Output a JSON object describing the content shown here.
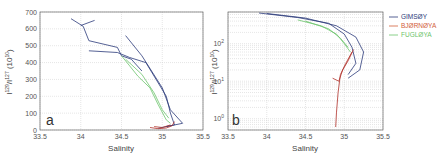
{
  "chart_data": [
    {
      "panel": "a",
      "type": "line",
      "title": "",
      "xlabel": "Salinity",
      "ylabel": "I(129)/I(127) (10^10)",
      "xlim": [
        33.5,
        35.5
      ],
      "ylim": [
        0,
        700
      ],
      "xticks": [
        "33.5",
        "34",
        "34.5",
        "35",
        "35.5"
      ],
      "yticks": [
        "0",
        "100",
        "200",
        "300",
        "400",
        "500",
        "600",
        "700"
      ],
      "grid": true,
      "yscale": "linear",
      "series": [
        {
          "name": "GIMSØY",
          "color": "#2b3a7a",
          "points": [
            [
              33.88,
              660
            ],
            [
              34.03,
              615
            ],
            [
              34.1,
              530
            ],
            [
              34.45,
              490
            ],
            [
              34.5,
              440
            ],
            [
              34.62,
              420
            ],
            [
              34.75,
              350
            ]
          ]
        },
        {
          "name": "GIMSØY",
          "color": "#2b3a7a",
          "points": [
            [
              34.1,
              470
            ],
            [
              34.45,
              460
            ],
            [
              34.6,
              430
            ],
            [
              34.8,
              400
            ],
            [
              35.05,
              200
            ],
            [
              35.1,
              100
            ],
            [
              35.15,
              30
            ],
            [
              34.95,
              10
            ]
          ]
        },
        {
          "name": "GIMSØY",
          "color": "#2b3a7a",
          "points": [
            [
              34.55,
              560
            ],
            [
              34.75,
              440
            ],
            [
              35.0,
              250
            ],
            [
              35.1,
              120
            ],
            [
              35.25,
              40
            ],
            [
              35.05,
              20
            ]
          ]
        },
        {
          "name": "GIMSØY",
          "color": "#2b3a7a",
          "points": [
            [
              34.0,
              620
            ],
            [
              34.17,
              650
            ]
          ]
        },
        {
          "name": "FUGLØYA",
          "color": "#6cc46c",
          "points": [
            [
              34.5,
              440
            ],
            [
              34.6,
              380
            ],
            [
              34.7,
              320
            ],
            [
              34.85,
              250
            ],
            [
              34.95,
              150
            ],
            [
              35.05,
              60
            ],
            [
              35.1,
              40
            ]
          ]
        },
        {
          "name": "FUGLØYA",
          "color": "#6cc46c",
          "points": [
            [
              34.55,
              420
            ],
            [
              34.75,
              330
            ],
            [
              34.9,
              220
            ],
            [
              35.0,
              120
            ],
            [
              35.08,
              70
            ]
          ]
        },
        {
          "name": "BJØRNØYA",
          "color": "#b0302a",
          "points": [
            [
              34.85,
              15
            ],
            [
              34.95,
              8
            ],
            [
              35.05,
              12
            ],
            [
              35.12,
              25
            ],
            [
              35.15,
              50
            ]
          ]
        },
        {
          "name": "BJØRNØYA",
          "color": "#b0302a",
          "points": [
            [
              34.9,
              20
            ],
            [
              35.0,
              15
            ],
            [
              35.1,
              30
            ]
          ]
        }
      ],
      "annotation": "a"
    },
    {
      "panel": "b",
      "type": "line",
      "title": "",
      "xlabel": "Salinity",
      "ylabel": "I(129)/I(127) (10^10)",
      "xlim": [
        33.5,
        35.5
      ],
      "ylim": [
        0.5,
        700
      ],
      "xticks": [
        "33.5",
        "34",
        "34.5",
        "35",
        "35.5"
      ],
      "yticks": [
        "10^0",
        "10^1",
        "10^2"
      ],
      "grid": true,
      "yscale": "log",
      "series": [
        {
          "name": "GIMSØY",
          "color": "#2b3a7a",
          "points": [
            [
              33.9,
              660
            ],
            [
              34.4,
              500
            ],
            [
              34.8,
              350
            ],
            [
              35.0,
              180
            ],
            [
              35.1,
              80
            ],
            [
              35.15,
              30
            ],
            [
              35.05,
              15
            ]
          ]
        },
        {
          "name": "GIMSØY",
          "color": "#2b3a7a",
          "points": [
            [
              34.0,
              640
            ],
            [
              34.5,
              480
            ],
            [
              34.9,
              300
            ],
            [
              35.15,
              150
            ],
            [
              35.25,
              60
            ],
            [
              35.2,
              20
            ],
            [
              35.05,
              12
            ]
          ]
        },
        {
          "name": "FUGLØYA",
          "color": "#6cc46c",
          "points": [
            [
              34.4,
              430
            ],
            [
              34.7,
              300
            ],
            [
              34.9,
              180
            ],
            [
              35.0,
              100
            ],
            [
              35.08,
              60
            ]
          ]
        },
        {
          "name": "FUGLØYA",
          "color": "#6cc46c",
          "points": [
            [
              34.5,
              400
            ],
            [
              34.8,
              250
            ],
            [
              34.95,
              140
            ],
            [
              35.05,
              80
            ]
          ]
        },
        {
          "name": "BJØRNØYA",
          "color": "#b0302a",
          "points": [
            [
              35.1,
              60
            ],
            [
              35.02,
              30
            ],
            [
              34.95,
              15
            ],
            [
              34.92,
              5
            ],
            [
              34.9,
              1.5
            ],
            [
              34.89,
              0.6
            ]
          ]
        },
        {
          "name": "BJØRNØYA",
          "color": "#b0302a",
          "points": [
            [
              35.12,
              70
            ],
            [
              35.05,
              35
            ],
            [
              34.98,
              20
            ],
            [
              34.93,
              10
            ],
            [
              34.85,
              12
            ]
          ]
        }
      ],
      "legend": {
        "position": "right",
        "entries": [
          {
            "label": "GIMSØY",
            "color": "#2b3a7a"
          },
          {
            "label": "BJØRNØYA",
            "color": "#d2603a"
          },
          {
            "label": "FUGLØYA",
            "color": "#6cc46c"
          }
        ]
      },
      "annotation": "b"
    }
  ],
  "labels": {
    "panel_a_letter": "a",
    "panel_b_letter": "b",
    "xlabel": "Salinity",
    "ylabel_main": "I",
    "ylabel_sup1": "129",
    "ylabel_mid": "/I",
    "ylabel_sup2": "127",
    "ylabel_unit": " (10",
    "ylabel_unit_sup": "10",
    "ylabel_close": ")",
    "a_xticks": [
      "33.5",
      "34",
      "34.5",
      "35",
      "35.5"
    ],
    "a_yticks": [
      "0",
      "100",
      "200",
      "300",
      "400",
      "500",
      "600",
      "700"
    ],
    "b_xticks": [
      "33.5",
      "34",
      "34.5",
      "35",
      "35.5"
    ],
    "b_yticks_base": [
      "10",
      "10",
      "10"
    ],
    "b_yticks_exp": [
      "0",
      "1",
      "2"
    ],
    "legend": [
      {
        "label": "GIMSØY",
        "color": "#2b3a7a"
      },
      {
        "label": "BJØRNØYA",
        "color": "#d2603a"
      },
      {
        "label": "FUGLØYA",
        "color": "#6cc46c"
      }
    ]
  }
}
